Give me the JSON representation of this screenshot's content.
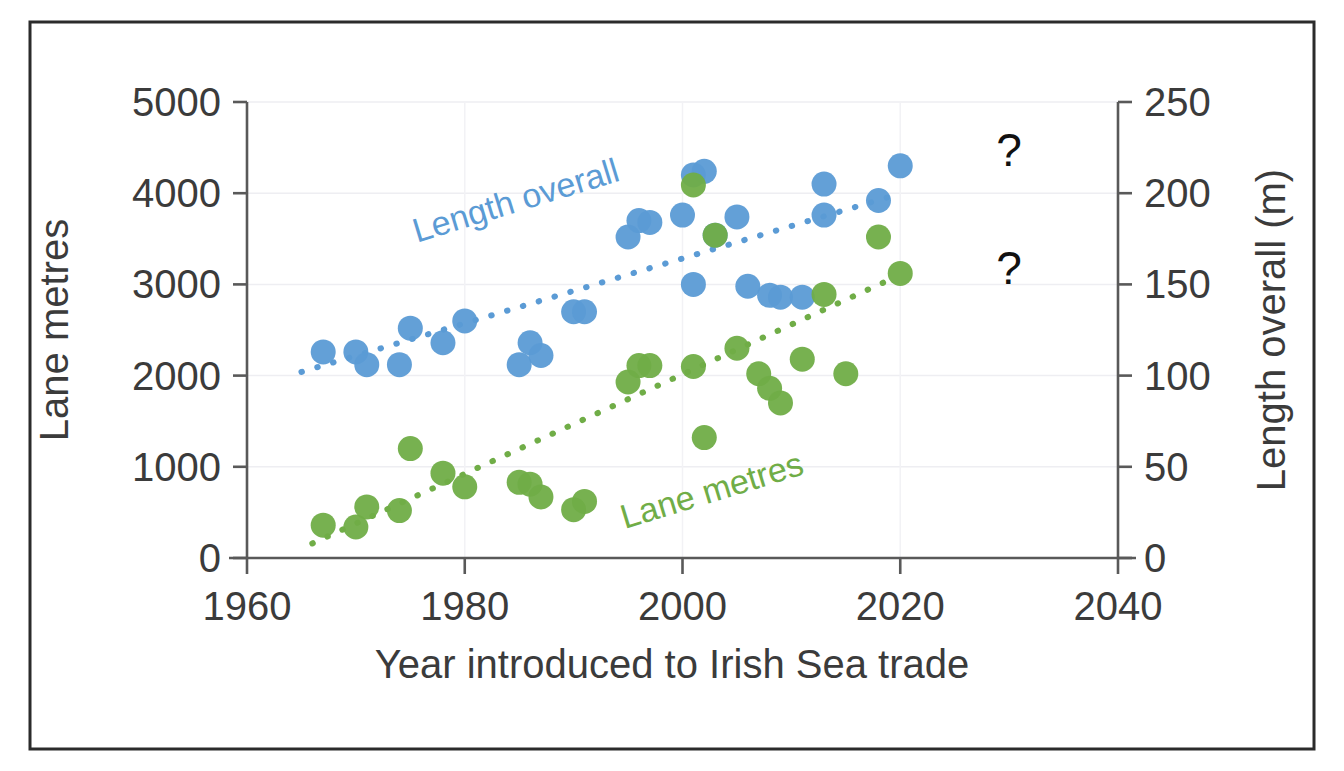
{
  "figure": {
    "border_color": "#2b2b2b",
    "background": "#ffffff"
  },
  "chart_data": {
    "type": "scatter",
    "title": "",
    "xlabel": "Year introduced to Irish Sea trade",
    "ylabel": "Lane metres",
    "y2label": "Length  overall (m)",
    "xlim": [
      1960,
      2040
    ],
    "xticks": [
      1960,
      1980,
      2000,
      2020,
      2040
    ],
    "xticklabels": [
      "1960",
      "1980",
      "2000",
      "2020",
      "2040"
    ],
    "ylim": [
      0,
      5000
    ],
    "yticks": [
      0,
      1000,
      2000,
      3000,
      4000,
      5000
    ],
    "yticklabels": [
      "0",
      "1000",
      "2000",
      "3000",
      "4000",
      "5000"
    ],
    "y2lim": [
      0,
      250
    ],
    "y2ticks": [
      0,
      50,
      100,
      150,
      200,
      250
    ],
    "y2ticklabels": [
      "0",
      "50",
      "100",
      "150",
      "200",
      "250"
    ],
    "grid": "horizontal-light",
    "legend_position": "inline-annotation",
    "series": [
      {
        "name": "Length overall",
        "axis": "right",
        "units": "m",
        "color": "#5B9BD5",
        "marker": "circle",
        "annotation": {
          "text": "Length overall",
          "x": 1985,
          "y": 190,
          "rotation": -17
        },
        "trendline": {
          "style": "dotted",
          "color": "#5B9BD5",
          "x_start": 1965,
          "y_start": 102,
          "x_end": 2019,
          "y_end": 198
        },
        "points": [
          {
            "x": 1967,
            "y": 113
          },
          {
            "x": 1970,
            "y": 113
          },
          {
            "x": 1971,
            "y": 106
          },
          {
            "x": 1974,
            "y": 106
          },
          {
            "x": 1975,
            "y": 126
          },
          {
            "x": 1978,
            "y": 118
          },
          {
            "x": 1980,
            "y": 130
          },
          {
            "x": 1985,
            "y": 106
          },
          {
            "x": 1986,
            "y": 118
          },
          {
            "x": 1987,
            "y": 111
          },
          {
            "x": 1990,
            "y": 135
          },
          {
            "x": 1991,
            "y": 135
          },
          {
            "x": 1995,
            "y": 176
          },
          {
            "x": 1996,
            "y": 185
          },
          {
            "x": 1997,
            "y": 184
          },
          {
            "x": 2000,
            "y": 188
          },
          {
            "x": 2001,
            "y": 210
          },
          {
            "x": 2002,
            "y": 212
          },
          {
            "x": 2001,
            "y": 150
          },
          {
            "x": 2003,
            "y": 177
          },
          {
            "x": 2005,
            "y": 187
          },
          {
            "x": 2006,
            "y": 149
          },
          {
            "x": 2008,
            "y": 144
          },
          {
            "x": 2009,
            "y": 143
          },
          {
            "x": 2011,
            "y": 143
          },
          {
            "x": 2013,
            "y": 188
          },
          {
            "x": 2013,
            "y": 205
          },
          {
            "x": 2018,
            "y": 196
          },
          {
            "x": 2020,
            "y": 215
          }
        ]
      },
      {
        "name": "Lane metres",
        "axis": "left",
        "units": "lane metres",
        "color": "#70AD47",
        "marker": "circle",
        "annotation": {
          "text": "Lane metres",
          "x": 2003,
          "y": 620,
          "rotation": -17
        },
        "trendline": {
          "style": "dotted",
          "color": "#70AD47",
          "x_start": 1966,
          "y_start": 160,
          "x_end": 2019,
          "y_end": 3050
        },
        "points": [
          {
            "x": 1967,
            "y": 360
          },
          {
            "x": 1970,
            "y": 340
          },
          {
            "x": 1971,
            "y": 560
          },
          {
            "x": 1974,
            "y": 520
          },
          {
            "x": 1975,
            "y": 1200
          },
          {
            "x": 1978,
            "y": 930
          },
          {
            "x": 1980,
            "y": 780
          },
          {
            "x": 1985,
            "y": 830
          },
          {
            "x": 1986,
            "y": 810
          },
          {
            "x": 1987,
            "y": 670
          },
          {
            "x": 1990,
            "y": 530
          },
          {
            "x": 1991,
            "y": 620
          },
          {
            "x": 1995,
            "y": 1930
          },
          {
            "x": 1996,
            "y": 2110
          },
          {
            "x": 1997,
            "y": 2110
          },
          {
            "x": 2001,
            "y": 4090
          },
          {
            "x": 2001,
            "y": 2100
          },
          {
            "x": 2003,
            "y": 3540
          },
          {
            "x": 2002,
            "y": 1320
          },
          {
            "x": 2005,
            "y": 2300
          },
          {
            "x": 2007,
            "y": 2020
          },
          {
            "x": 2008,
            "y": 1860
          },
          {
            "x": 2009,
            "y": 1700
          },
          {
            "x": 2011,
            "y": 2180
          },
          {
            "x": 2013,
            "y": 2890
          },
          {
            "x": 2015,
            "y": 2020
          },
          {
            "x": 2018,
            "y": 3520
          },
          {
            "x": 2020,
            "y": 3120
          }
        ]
      }
    ],
    "annotations": [
      {
        "text": "?",
        "x": 2030,
        "y_axis": "left",
        "y": 4300,
        "name": "question-mark-upper"
      },
      {
        "text": "?",
        "x": 2030,
        "y_axis": "left",
        "y": 3000,
        "name": "question-mark-lower"
      }
    ]
  }
}
